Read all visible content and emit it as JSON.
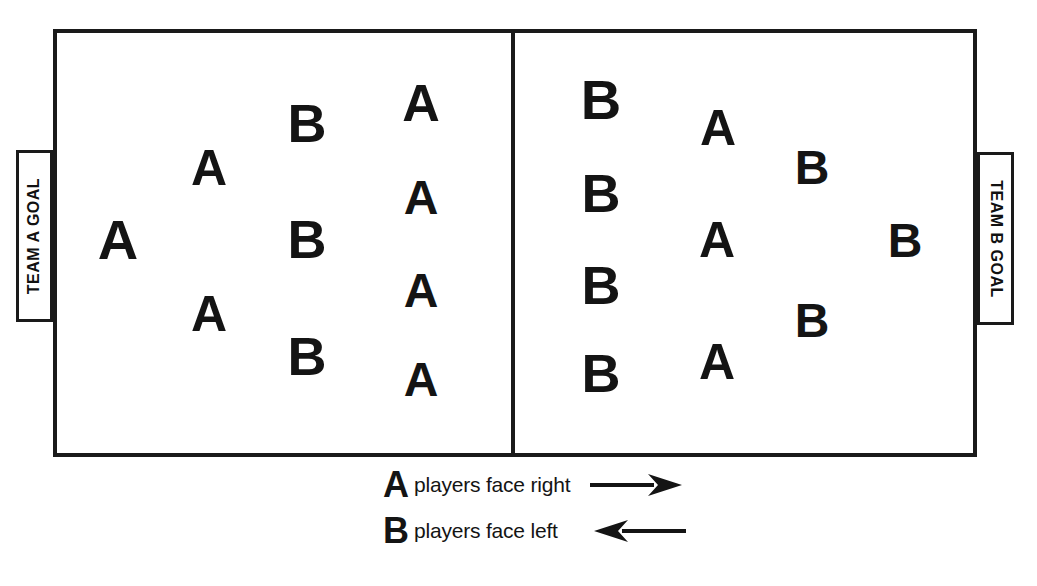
{
  "diagram": {
    "field": {
      "left_half_name": "Team A half",
      "right_half_name": "Team B half"
    },
    "goals": {
      "left": {
        "label": "TEAM A GOAL",
        "orientation": "bottom-to-top"
      },
      "right": {
        "label": "TEAM B GOAL",
        "orientation": "top-to-bottom"
      }
    },
    "legend": {
      "rows": [
        {
          "letter": "A",
          "text": "players face right",
          "arrow": "arrow-right",
          "direction": "right"
        },
        {
          "letter": "B",
          "text": "players face left",
          "arrow": "arrow-left",
          "direction": "left"
        }
      ]
    },
    "players": {
      "left_half": [
        {
          "label": "A",
          "x": 118,
          "y": 240,
          "size": 56
        },
        {
          "label": "A",
          "x": 209,
          "y": 168,
          "size": 50
        },
        {
          "label": "A",
          "x": 209,
          "y": 314,
          "size": 50
        },
        {
          "label": "B",
          "x": 307,
          "y": 123,
          "size": 54
        },
        {
          "label": "B",
          "x": 307,
          "y": 239,
          "size": 54
        },
        {
          "label": "B",
          "x": 307,
          "y": 356,
          "size": 54
        },
        {
          "label": "A",
          "x": 421,
          "y": 103,
          "size": 52
        },
        {
          "label": "A",
          "x": 421,
          "y": 198,
          "size": 48
        },
        {
          "label": "A",
          "x": 421,
          "y": 291,
          "size": 48
        },
        {
          "label": "A",
          "x": 421,
          "y": 380,
          "size": 48
        }
      ],
      "right_half": [
        {
          "label": "B",
          "x": 601,
          "y": 100,
          "size": 56
        },
        {
          "label": "B",
          "x": 601,
          "y": 193,
          "size": 54
        },
        {
          "label": "B",
          "x": 601,
          "y": 285,
          "size": 54
        },
        {
          "label": "B",
          "x": 601,
          "y": 373,
          "size": 54
        },
        {
          "label": "A",
          "x": 718,
          "y": 128,
          "size": 50
        },
        {
          "label": "A",
          "x": 717,
          "y": 240,
          "size": 50
        },
        {
          "label": "A",
          "x": 717,
          "y": 362,
          "size": 50
        },
        {
          "label": "B",
          "x": 812,
          "y": 168,
          "size": 48
        },
        {
          "label": "B",
          "x": 812,
          "y": 321,
          "size": 48
        },
        {
          "label": "B",
          "x": 905,
          "y": 241,
          "size": 48
        }
      ]
    },
    "counts": {
      "left_half_A": 6,
      "left_half_B": 3,
      "right_half_A": 3,
      "right_half_B": 7,
      "total_A": 9,
      "total_B": 10
    },
    "colors": {
      "ink": "#141414",
      "line": "#1a1a1a",
      "background": "#ffffff"
    }
  }
}
